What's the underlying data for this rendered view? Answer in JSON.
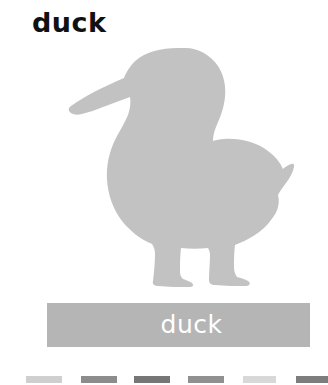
{
  "card": {
    "title": "duck",
    "background_color": "#ffffff"
  },
  "illustration": {
    "name": "duck-silhouette",
    "fill_color": "#c2c2c2",
    "description": "duck"
  },
  "label_bar": {
    "text": "duck",
    "background_color": "#b5b5b5",
    "text_color": "#ffffff"
  },
  "swatches": [
    {
      "name": "swatch-1",
      "color": "#cfcfcf",
      "left": 26,
      "width": 36
    },
    {
      "name": "swatch-2",
      "color": "#8c8c8c",
      "left": 81,
      "width": 36
    },
    {
      "name": "swatch-3",
      "color": "#767676",
      "left": 134,
      "width": 36
    },
    {
      "name": "swatch-4",
      "color": "#909090",
      "left": 188,
      "width": 36
    },
    {
      "name": "swatch-5",
      "color": "#d8d8d8",
      "left": 243,
      "width": 33
    },
    {
      "name": "swatch-6",
      "color": "#7d7d7d",
      "left": 296,
      "width": 32
    }
  ]
}
